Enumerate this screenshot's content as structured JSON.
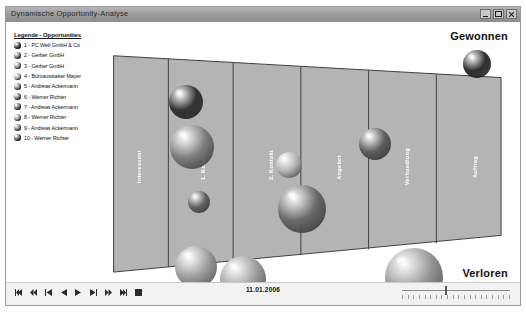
{
  "window": {
    "title": "Dynamische Opportunity-Analyse",
    "buttons": {
      "minimize": "Minimieren",
      "maximize": "Maximieren",
      "close": "Schließen"
    }
  },
  "legend": {
    "title": "Legende - Opportunities",
    "items": [
      {
        "n": "1",
        "label": "1 - PC Welt GmbH & Co",
        "color": "#3a3a3a"
      },
      {
        "n": "2",
        "label": "2 - Gerber GmbH",
        "color": "#6b6b6b"
      },
      {
        "n": "3",
        "label": "3 - Gerber GmbH",
        "color": "#8a8a8a"
      },
      {
        "n": "4",
        "label": "4 - Büroausstatter Mayer",
        "color": "#a5a5a5"
      },
      {
        "n": "5",
        "label": "5 - Andreas Ackermann",
        "color": "#7d7d7d"
      },
      {
        "n": "6",
        "label": "6 - Werner Richter",
        "color": "#6f6f6f"
      },
      {
        "n": "7",
        "label": "7 - Andreas Ackermann",
        "color": "#5f5f5f"
      },
      {
        "n": "8",
        "label": "8 - Werner Richter",
        "color": "#8f8f8f"
      },
      {
        "n": "9",
        "label": "9 - Andreas Ackermann",
        "color": "#787878"
      },
      {
        "n": "10",
        "label": "10 - Werner Richter",
        "color": "#555555"
      }
    ]
  },
  "chart_data": {
    "type": "scatter",
    "title": "Dynamische Opportunity-Analyse",
    "outcome_top": "Gewonnen",
    "outcome_bottom": "Verloren",
    "current_date": "11.01.2006",
    "stages": [
      {
        "label": "Interessent"
      },
      {
        "label": "1. Kontakt"
      },
      {
        "label": "2. Kontakt"
      },
      {
        "label": "Angebot"
      },
      {
        "label": "Verhandlung"
      },
      {
        "label": "Auftrag"
      }
    ],
    "bubbles": [
      {
        "stage": "1. Kontakt",
        "cx": 180,
        "cy": 80,
        "r": 17,
        "color": "#333333"
      },
      {
        "stage": "1. Kontakt",
        "cx": 186,
        "cy": 125,
        "r": 22,
        "color": "#7e7e7e"
      },
      {
        "stage": "1. Kontakt",
        "cx": 193,
        "cy": 180,
        "r": 11,
        "color": "#606060"
      },
      {
        "stage": "1. Kontakt",
        "cx": 190,
        "cy": 245,
        "r": 21,
        "color": "#9d9d9d"
      },
      {
        "stage": "1. Kontakt",
        "cx": 237,
        "cy": 257,
        "r": 23,
        "color": "#9b9b9b"
      },
      {
        "stage": "2. Kontakt",
        "cx": 283,
        "cy": 143,
        "r": 13,
        "color": "#b3b3b3"
      },
      {
        "stage": "2. Kontakt",
        "cx": 296,
        "cy": 187,
        "r": 24,
        "color": "#6a6a6a"
      },
      {
        "stage": "Verhandlung",
        "cx": 369,
        "cy": 122,
        "r": 16,
        "color": "#5e5e5e"
      },
      {
        "stage": "Verhandlung",
        "cx": 408,
        "cy": 255,
        "r": 29,
        "color": "#949494"
      },
      {
        "stage": "Gewonnen",
        "cx": 471,
        "cy": 42,
        "r": 14,
        "color": "#2e2e2e"
      }
    ]
  },
  "transport": {
    "buttons": [
      {
        "name": "skip-start",
        "glyph": "first"
      },
      {
        "name": "rewind-fast",
        "glyph": "rew"
      },
      {
        "name": "step-back",
        "glyph": "stepback"
      },
      {
        "name": "play-reverse",
        "glyph": "playrev"
      },
      {
        "name": "play",
        "glyph": "play"
      },
      {
        "name": "step-forward",
        "glyph": "stepfwd"
      },
      {
        "name": "forward-fast",
        "glyph": "ffwd"
      },
      {
        "name": "skip-end",
        "glyph": "last"
      },
      {
        "name": "stop",
        "glyph": "stop"
      }
    ]
  },
  "slider": {
    "value_pct": 40,
    "ticks": 20
  }
}
